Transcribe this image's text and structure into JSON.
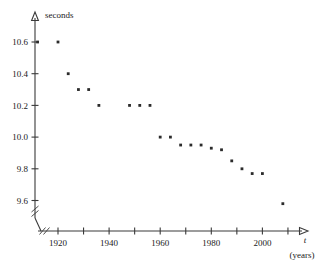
{
  "chart_data": {
    "type": "scatter",
    "title": "",
    "xlabel": "t",
    "xlabel_units": "(years)",
    "ylabel": "seconds",
    "xlim": [
      1908,
      2016
    ],
    "ylim": [
      9.5,
      10.72
    ],
    "grid": false,
    "legend": null,
    "x_ticks": [
      1920,
      1930,
      1940,
      1950,
      1960,
      1970,
      1980,
      1990,
      2000,
      2010
    ],
    "x_tick_labels": [
      "1920",
      "",
      "1940",
      "",
      "1960",
      "",
      "1980",
      "",
      "2000",
      ""
    ],
    "y_ticks": [
      9.6,
      9.8,
      10.0,
      10.2,
      10.4,
      10.6
    ],
    "y_tick_labels": [
      "9.6",
      "9.8",
      "10.0",
      "10.2",
      "10.4",
      "10.6"
    ],
    "axis_break_x": true,
    "axis_break_y": true,
    "x": [
      1912,
      1920,
      1924,
      1928,
      1932,
      1936,
      1948,
      1952,
      1956,
      1960,
      1964,
      1968,
      1972,
      1976,
      1980,
      1984,
      1988,
      1992,
      1996,
      2000,
      2008
    ],
    "y": [
      10.6,
      10.6,
      10.4,
      10.3,
      10.3,
      10.2,
      10.2,
      10.2,
      10.2,
      10.0,
      10.0,
      9.95,
      9.95,
      9.95,
      9.93,
      9.92,
      9.85,
      9.8,
      9.77,
      9.77,
      9.58
    ],
    "point_count": 21,
    "point_color": "#2b2b2b",
    "series": [
      {
        "name": "winning time",
        "points": [
          {
            "x": 1912,
            "y": 10.6
          },
          {
            "x": 1920,
            "y": 10.6
          },
          {
            "x": 1924,
            "y": 10.4
          },
          {
            "x": 1928,
            "y": 10.3
          },
          {
            "x": 1932,
            "y": 10.3
          },
          {
            "x": 1936,
            "y": 10.2
          },
          {
            "x": 1948,
            "y": 10.2
          },
          {
            "x": 1952,
            "y": 10.2
          },
          {
            "x": 1956,
            "y": 10.2
          },
          {
            "x": 1960,
            "y": 10.0
          },
          {
            "x": 1964,
            "y": 10.0
          },
          {
            "x": 1968,
            "y": 9.95
          },
          {
            "x": 1972,
            "y": 9.95
          },
          {
            "x": 1976,
            "y": 9.95
          },
          {
            "x": 1980,
            "y": 9.93
          },
          {
            "x": 1984,
            "y": 9.92
          },
          {
            "x": 1988,
            "y": 9.85
          },
          {
            "x": 1992,
            "y": 9.8
          },
          {
            "x": 1996,
            "y": 9.77
          },
          {
            "x": 2000,
            "y": 9.77
          },
          {
            "x": 2008,
            "y": 9.58
          }
        ]
      }
    ]
  }
}
